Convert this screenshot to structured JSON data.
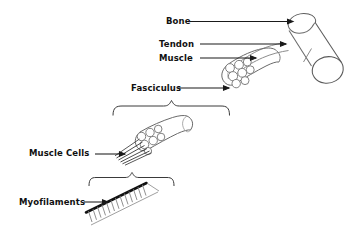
{
  "diagram": {
    "background_color": "#ffffff",
    "ink_color": "#000000",
    "outline_color": "#555555",
    "label_color": "#111111",
    "width": 359,
    "height": 241
  },
  "labels": {
    "bone": "Bone",
    "tendon": "Tendon",
    "muscle": "Muscle",
    "fasciculus": "Fasciculus",
    "muscle_cells": "Muscle Cells",
    "myofilaments": "Myofilaments"
  },
  "structures": [
    {
      "name": "bone",
      "label": "Bone",
      "shape": "cylinder",
      "description": "Tilted long bone cylinder at upper right"
    },
    {
      "name": "tendon",
      "label": "Tendon",
      "shape": "tapered-band",
      "description": "Thin band connecting muscle to bone"
    },
    {
      "name": "muscle",
      "label": "Muscle",
      "shape": "cut-cylinder",
      "description": "Whole muscle with cut end exposing fascicles"
    },
    {
      "name": "fasciculus",
      "label": "Fasciculus",
      "shape": "cut-cylinder",
      "description": "Bundle of muscle cells, shown magnified"
    },
    {
      "name": "muscle-cells",
      "label": "Muscle Cells",
      "shape": "fiber-strands",
      "description": "Individual muscle fibers splaying from fasciculus"
    },
    {
      "name": "myofilaments",
      "label": "Myofilaments",
      "shape": "striated-band",
      "description": "Thick myosin filament with thin actin filaments"
    }
  ],
  "magnification_braces": [
    {
      "name": "fasciculus-brace",
      "from": "muscle-cut-end",
      "to": "fasciculus"
    },
    {
      "name": "myofilaments-brace",
      "from": "muscle-cells",
      "to": "myofilaments"
    }
  ],
  "fascicle_count_muscle": 7,
  "fascicle_count_fasciculus": 6
}
